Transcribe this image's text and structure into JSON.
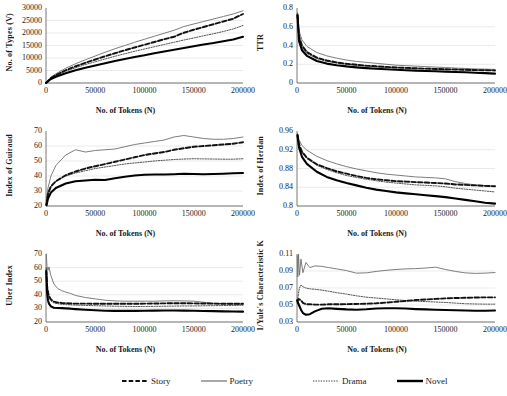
{
  "figure": {
    "xlabel": "No. of Tokens (N)",
    "xticks": [
      "0",
      "50000",
      "100000",
      "150000",
      "200000"
    ],
    "xlim": [
      0,
      200000
    ]
  },
  "legend": {
    "items": [
      {
        "label": "Story",
        "style": "dashed",
        "color": "#111111"
      },
      {
        "label": "Poetry",
        "style": "thin-solid",
        "color": "#6e6e6e"
      },
      {
        "label": "Drama",
        "style": "dotted",
        "color": "#333333"
      },
      {
        "label": "Novel",
        "style": "thick-solid",
        "color": "#000000"
      }
    ]
  },
  "chart_data": [
    {
      "type": "line",
      "title": "",
      "xlabel": "No. of Tokens (N)",
      "ylabel": "No. of Types (V)",
      "xlim": [
        0,
        200000
      ],
      "ylim": [
        0,
        30000
      ],
      "yticks": [
        "0",
        "5000",
        "10000",
        "15000",
        "20000",
        "25000",
        "30000"
      ],
      "grid": true,
      "x": [
        0,
        5000,
        10000,
        20000,
        30000,
        40000,
        50000,
        60000,
        70000,
        80000,
        90000,
        100000,
        110000,
        120000,
        130000,
        140000,
        150000,
        160000,
        170000,
        180000,
        190000,
        200000
      ],
      "series": [
        {
          "name": "Poetry",
          "values": [
            0,
            2300,
            3700,
            5900,
            7700,
            9300,
            10800,
            12300,
            13700,
            15000,
            16300,
            17500,
            18700,
            19900,
            21100,
            22600,
            23600,
            24600,
            25600,
            26600,
            27600,
            28900
          ]
        },
        {
          "name": "Story",
          "values": [
            0,
            2000,
            3200,
            5100,
            6700,
            8100,
            9400,
            10700,
            11900,
            13100,
            14200,
            15300,
            16400,
            17500,
            18500,
            20100,
            21300,
            22400,
            23500,
            24600,
            25700,
            27600
          ]
        },
        {
          "name": "Drama",
          "values": [
            0,
            1900,
            3000,
            4700,
            6100,
            7400,
            8500,
            9600,
            10700,
            11700,
            12700,
            13600,
            14500,
            15400,
            16300,
            17200,
            18000,
            18900,
            19700,
            20600,
            21600,
            23000
          ]
        },
        {
          "name": "Novel",
          "values": [
            0,
            1600,
            2500,
            3900,
            5100,
            6100,
            7000,
            7900,
            8800,
            9600,
            10400,
            11100,
            11900,
            12600,
            13300,
            14000,
            14700,
            15400,
            16000,
            16700,
            17400,
            18500
          ]
        }
      ]
    },
    {
      "type": "line",
      "title": "",
      "xlabel": "No. of Tokens (N)",
      "ylabel": "TTR",
      "xlim": [
        0,
        200000
      ],
      "ylim": [
        0,
        0.8
      ],
      "yticks": [
        "0",
        "0.2",
        "0.4",
        "0.6",
        "0.8"
      ],
      "grid": true,
      "x": [
        500,
        2000,
        5000,
        10000,
        20000,
        30000,
        40000,
        50000,
        60000,
        70000,
        80000,
        90000,
        100000,
        110000,
        120000,
        130000,
        140000,
        150000,
        160000,
        170000,
        180000,
        190000,
        200000
      ],
      "series": [
        {
          "name": "Poetry",
          "values": [
            0.75,
            0.56,
            0.46,
            0.39,
            0.325,
            0.29,
            0.265,
            0.245,
            0.23,
            0.22,
            0.21,
            0.2,
            0.19,
            0.185,
            0.18,
            0.175,
            0.17,
            0.165,
            0.16,
            0.155,
            0.15,
            0.148,
            0.145
          ]
        },
        {
          "name": "Story",
          "values": [
            0.73,
            0.5,
            0.4,
            0.33,
            0.27,
            0.24,
            0.22,
            0.205,
            0.195,
            0.185,
            0.178,
            0.172,
            0.166,
            0.161,
            0.157,
            0.153,
            0.15,
            0.147,
            0.144,
            0.141,
            0.138,
            0.136,
            0.134
          ]
        },
        {
          "name": "Drama",
          "values": [
            0.72,
            0.48,
            0.38,
            0.315,
            0.26,
            0.232,
            0.213,
            0.2,
            0.19,
            0.181,
            0.174,
            0.168,
            0.163,
            0.159,
            0.155,
            0.152,
            0.149,
            0.146,
            0.143,
            0.14,
            0.138,
            0.136,
            0.134
          ]
        },
        {
          "name": "Novel",
          "values": [
            0.72,
            0.45,
            0.35,
            0.29,
            0.235,
            0.207,
            0.19,
            0.177,
            0.167,
            0.159,
            0.152,
            0.146,
            0.141,
            0.136,
            0.132,
            0.128,
            0.125,
            0.121,
            0.118,
            0.114,
            0.11,
            0.105,
            0.1
          ]
        }
      ]
    },
    {
      "type": "line",
      "title": "",
      "xlabel": "No. of Tokens (N)",
      "ylabel": "Index of Guiraud",
      "xlim": [
        0,
        200000
      ],
      "ylim": [
        20,
        70
      ],
      "yticks": [
        "20",
        "30",
        "40",
        "50",
        "60",
        "70"
      ],
      "grid": true,
      "x": [
        500,
        2000,
        5000,
        10000,
        20000,
        30000,
        40000,
        50000,
        60000,
        70000,
        80000,
        90000,
        100000,
        110000,
        120000,
        130000,
        140000,
        150000,
        160000,
        170000,
        180000,
        190000,
        200000
      ],
      "series": [
        {
          "name": "Poetry",
          "values": [
            24,
            32,
            40,
            47,
            54,
            57.5,
            56,
            57,
            57.5,
            58,
            59.5,
            61,
            62,
            63,
            64,
            66,
            67,
            66,
            65,
            64.5,
            64.5,
            65,
            66
          ]
        },
        {
          "name": "Story",
          "values": [
            21,
            28,
            33,
            36.5,
            40.5,
            43,
            45,
            46.5,
            48,
            49.5,
            51,
            52.5,
            54,
            55,
            56,
            57.5,
            58.5,
            59.5,
            60,
            60.5,
            61,
            61.5,
            62.5
          ]
        },
        {
          "name": "Drama",
          "values": [
            22,
            29,
            33.5,
            36.5,
            40,
            42,
            43.5,
            45,
            46,
            47,
            48,
            48.7,
            49.3,
            50,
            50.5,
            51,
            51.3,
            51.5,
            51.4,
            51.3,
            51.2,
            51.2,
            51.5
          ]
        },
        {
          "name": "Novel",
          "values": [
            20.5,
            25,
            29,
            32,
            35,
            36.5,
            37,
            37.5,
            37.3,
            38.5,
            39.5,
            40.3,
            40.8,
            41,
            41,
            41.2,
            41.5,
            41.3,
            41.2,
            41.3,
            41.5,
            41.8,
            42
          ]
        }
      ]
    },
    {
      "type": "line",
      "title": "",
      "xlabel": "No. of Tokens (N)",
      "ylabel": "Index of Herdan",
      "xlim": [
        0,
        200000
      ],
      "ylim": [
        0.8,
        0.96
      ],
      "yticks": [
        "0.8",
        "0.84",
        "0.88",
        "0.92",
        "0.96"
      ],
      "grid": true,
      "x": [
        500,
        2000,
        5000,
        10000,
        20000,
        30000,
        40000,
        50000,
        60000,
        70000,
        80000,
        90000,
        100000,
        110000,
        120000,
        130000,
        140000,
        150000,
        160000,
        170000,
        180000,
        190000,
        200000
      ],
      "series": [
        {
          "name": "Poetry",
          "values": [
            0.955,
            0.941,
            0.929,
            0.919,
            0.906,
            0.897,
            0.89,
            0.884,
            0.879,
            0.875,
            0.871,
            0.868,
            0.866,
            0.864,
            0.862,
            0.861,
            0.86,
            0.858,
            0.852,
            0.848,
            0.845,
            0.843,
            0.842
          ]
        },
        {
          "name": "Story",
          "values": [
            0.952,
            0.932,
            0.916,
            0.903,
            0.889,
            0.881,
            0.874,
            0.869,
            0.864,
            0.86,
            0.857,
            0.855,
            0.853,
            0.852,
            0.851,
            0.85,
            0.849,
            0.848,
            0.846,
            0.845,
            0.844,
            0.843,
            0.842
          ]
        },
        {
          "name": "Drama",
          "values": [
            0.95,
            0.93,
            0.914,
            0.901,
            0.887,
            0.878,
            0.871,
            0.865,
            0.861,
            0.857,
            0.854,
            0.851,
            0.849,
            0.847,
            0.845,
            0.844,
            0.843,
            0.841,
            0.838,
            0.836,
            0.834,
            0.832,
            0.83
          ]
        },
        {
          "name": "Novel",
          "values": [
            0.95,
            0.925,
            0.905,
            0.89,
            0.873,
            0.862,
            0.855,
            0.849,
            0.844,
            0.839,
            0.835,
            0.832,
            0.829,
            0.827,
            0.825,
            0.823,
            0.821,
            0.819,
            0.816,
            0.813,
            0.81,
            0.807,
            0.805
          ]
        }
      ]
    },
    {
      "type": "line",
      "title": "",
      "xlabel": "No. of Tokens (N)",
      "ylabel": "Uber Index",
      "xlim": [
        0,
        200000
      ],
      "ylim": [
        20,
        70
      ],
      "yticks": [
        "20",
        "30",
        "40",
        "50",
        "60",
        "70"
      ],
      "grid": true,
      "x": [
        300,
        1000,
        2000,
        3000,
        5000,
        8000,
        12000,
        16000,
        20000,
        25000,
        30000,
        40000,
        50000,
        60000,
        70000,
        80000,
        90000,
        100000,
        110000,
        120000,
        130000,
        140000,
        150000,
        160000,
        170000,
        180000,
        190000,
        200000
      ],
      "series": [
        {
          "name": "Poetry",
          "values": [
            70,
            61,
            58,
            60.5,
            54,
            48,
            44.5,
            43,
            42,
            41,
            39.5,
            38,
            37,
            36,
            35.5,
            35.3,
            35.3,
            35.3,
            35.3,
            35.5,
            35.6,
            35.5,
            35.3,
            34.5,
            33.8,
            33.4,
            33.2,
            33
          ]
        },
        {
          "name": "Story",
          "values": [
            58,
            47,
            42,
            39,
            36.5,
            35,
            34.3,
            34,
            33.8,
            33.6,
            33.5,
            33.5,
            33.4,
            33.4,
            33.4,
            33.4,
            33.4,
            33.5,
            33.6,
            33.7,
            33.8,
            33.8,
            33.7,
            33.6,
            33.5,
            33.4,
            33.4,
            33.4
          ]
        },
        {
          "name": "Drama",
          "values": [
            60,
            48,
            42,
            38.5,
            35.5,
            34,
            33.4,
            33,
            32.8,
            32.6,
            32.4,
            32.2,
            32,
            31.8,
            31.6,
            31.5,
            31.4,
            31.4,
            31.5,
            31.6,
            31.7,
            31.8,
            31.8,
            31.9,
            32,
            32.1,
            32.2,
            32.3
          ]
        },
        {
          "name": "Novel",
          "values": [
            57,
            42,
            36,
            33.5,
            31.5,
            30.5,
            30.3,
            30.2,
            30,
            29.8,
            29.5,
            29,
            28.6,
            28.3,
            28.2,
            28.2,
            28.2,
            28.3,
            28.4,
            28.5,
            28.5,
            28.4,
            28.3,
            28.1,
            28,
            27.8,
            27.7,
            27.6
          ]
        }
      ]
    },
    {
      "type": "line",
      "title": "",
      "xlabel": "No. of Tokens (N)",
      "ylabel": "1/Yule's Characteristic K",
      "xlim": [
        0,
        200000
      ],
      "ylim": [
        0.03,
        0.11
      ],
      "yticks": [
        "0.03",
        "0.05",
        "0.07",
        "0.09",
        "0.11"
      ],
      "grid": true,
      "x": [
        300,
        800,
        1500,
        2500,
        4000,
        6000,
        9000,
        13000,
        18000,
        25000,
        32000,
        40000,
        50000,
        60000,
        70000,
        80000,
        90000,
        100000,
        110000,
        120000,
        130000,
        140000,
        150000,
        160000,
        170000,
        180000,
        190000,
        200000
      ],
      "series": [
        {
          "name": "Poetry",
          "values": [
            0.108,
            0.083,
            0.11,
            0.085,
            0.104,
            0.088,
            0.1,
            0.094,
            0.096,
            0.0955,
            0.094,
            0.0925,
            0.0905,
            0.0875,
            0.0878,
            0.0895,
            0.0908,
            0.0918,
            0.0925,
            0.0928,
            0.0935,
            0.0945,
            0.0918,
            0.0895,
            0.0878,
            0.0872,
            0.0875,
            0.0882
          ]
        },
        {
          "name": "Story",
          "values": [
            0.056,
            0.055,
            0.057,
            0.0565,
            0.0555,
            0.0525,
            0.051,
            0.0508,
            0.0505,
            0.0505,
            0.0508,
            0.0508,
            0.051,
            0.0512,
            0.0515,
            0.052,
            0.0528,
            0.0538,
            0.0548,
            0.0558,
            0.0565,
            0.0572,
            0.0578,
            0.0582,
            0.0585,
            0.0588,
            0.059,
            0.059
          ]
        },
        {
          "name": "Drama",
          "values": [
            0.052,
            0.058,
            0.064,
            0.07,
            0.0735,
            0.0715,
            0.07,
            0.069,
            0.0685,
            0.0675,
            0.0662,
            0.0645,
            0.0628,
            0.0608,
            0.0592,
            0.0582,
            0.0572,
            0.0562,
            0.0552,
            0.0545,
            0.054,
            0.0535,
            0.053,
            0.0522,
            0.0515,
            0.0512,
            0.051,
            0.051
          ]
        },
        {
          "name": "Novel",
          "values": [
            0.055,
            0.0535,
            0.0512,
            0.0485,
            0.0445,
            0.0405,
            0.0385,
            0.0392,
            0.0425,
            0.0455,
            0.0462,
            0.0455,
            0.0448,
            0.0445,
            0.045,
            0.0458,
            0.0462,
            0.0462,
            0.0458,
            0.0452,
            0.0448,
            0.0445,
            0.0442,
            0.0438,
            0.0435,
            0.0432,
            0.0432,
            0.0435
          ]
        }
      ]
    }
  ]
}
